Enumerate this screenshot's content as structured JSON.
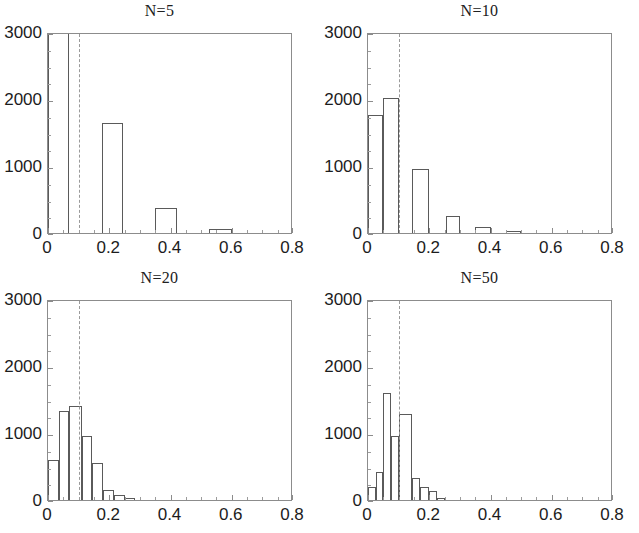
{
  "figure": {
    "background": "#ffffff",
    "axis_color": "#8c8c8c",
    "bar_edge_color": "#5a5a5a",
    "refline_color": "#9a9a9a",
    "panel_count": 4
  },
  "chart_data": [
    {
      "type": "bar",
      "title": "N=5",
      "xlabel": "",
      "ylabel": "",
      "xlim": [
        0,
        0.8
      ],
      "ylim": [
        0,
        3000
      ],
      "xticks": [
        0,
        0.2,
        0.4,
        0.6,
        0.8
      ],
      "xtick_labels": [
        "0",
        "0.2",
        "0.4",
        "0.6",
        "0.8"
      ],
      "xticks_minor": [
        0.05,
        0.1,
        0.15,
        0.25,
        0.3,
        0.35,
        0.45,
        0.5,
        0.55,
        0.65,
        0.7,
        0.75
      ],
      "yticks": [
        0,
        1000,
        2000,
        3000
      ],
      "ytick_labels": [
        "0",
        "1000",
        "2000",
        "3000"
      ],
      "yticks_minor": [
        250,
        500,
        750,
        1250,
        1500,
        1750,
        2250,
        2500,
        2750
      ],
      "grid": false,
      "legend": "none",
      "reference_line_x": 0.1,
      "bin_edges": [
        0.0,
        0.07,
        0.175,
        0.245,
        0.35,
        0.42,
        0.525,
        0.6
      ],
      "bins": [
        {
          "x0": 0.0,
          "x1": 0.07,
          "value": 2980
        },
        {
          "x0": 0.175,
          "x1": 0.245,
          "value": 1640
        },
        {
          "x0": 0.35,
          "x1": 0.42,
          "value": 380
        },
        {
          "x0": 0.525,
          "x1": 0.6,
          "value": 60
        }
      ]
    },
    {
      "type": "bar",
      "title": "N=10",
      "xlabel": "",
      "ylabel": "",
      "xlim": [
        0,
        0.8
      ],
      "ylim": [
        0,
        3000
      ],
      "xticks": [
        0,
        0.2,
        0.4,
        0.6,
        0.8
      ],
      "xtick_labels": [
        "0",
        "0.2",
        "0.4",
        "0.6",
        "0.8"
      ],
      "xticks_minor": [
        0.05,
        0.1,
        0.15,
        0.25,
        0.3,
        0.35,
        0.45,
        0.5,
        0.55,
        0.65,
        0.7,
        0.75
      ],
      "yticks": [
        0,
        1000,
        2000,
        3000
      ],
      "ytick_labels": [
        "0",
        "1000",
        "2000",
        "3000"
      ],
      "yticks_minor": [
        250,
        500,
        750,
        1250,
        1500,
        1750,
        2250,
        2500,
        2750
      ],
      "grid": false,
      "legend": "none",
      "reference_line_x": 0.1,
      "bin_edges": [
        0.0,
        0.05,
        0.1,
        0.145,
        0.2,
        0.255,
        0.3,
        0.35,
        0.4,
        0.45,
        0.5
      ],
      "bins": [
        {
          "x0": 0.0,
          "x1": 0.05,
          "value": 1760
        },
        {
          "x0": 0.05,
          "x1": 0.1,
          "value": 2020
        },
        {
          "x0": 0.145,
          "x1": 0.2,
          "value": 960
        },
        {
          "x0": 0.255,
          "x1": 0.3,
          "value": 250
        },
        {
          "x0": 0.35,
          "x1": 0.4,
          "value": 95
        },
        {
          "x0": 0.45,
          "x1": 0.5,
          "value": 35
        }
      ]
    },
    {
      "type": "bar",
      "title": "N=20",
      "xlabel": "",
      "ylabel": "",
      "xlim": [
        0,
        0.8
      ],
      "ylim": [
        0,
        3000
      ],
      "xticks": [
        0,
        0.2,
        0.4,
        0.6,
        0.8
      ],
      "xtick_labels": [
        "0",
        "0.2",
        "0.4",
        "0.6",
        "0.8"
      ],
      "xticks_minor": [
        0.05,
        0.1,
        0.15,
        0.25,
        0.3,
        0.35,
        0.45,
        0.5,
        0.55,
        0.65,
        0.7,
        0.75
      ],
      "yticks": [
        0,
        1000,
        2000,
        3000
      ],
      "ytick_labels": [
        "0",
        "1000",
        "2000",
        "3000"
      ],
      "yticks_minor": [
        250,
        500,
        750,
        1250,
        1500,
        1750,
        2250,
        2500,
        2750
      ],
      "grid": false,
      "legend": "none",
      "reference_line_x": 0.1,
      "bin_edges": [
        0.0,
        0.035,
        0.07,
        0.105,
        0.145,
        0.18,
        0.215,
        0.25,
        0.285,
        0.32
      ],
      "bins": [
        {
          "x0": 0.0,
          "x1": 0.035,
          "value": 590
        },
        {
          "x0": 0.035,
          "x1": 0.07,
          "value": 1330
        },
        {
          "x0": 0.07,
          "x1": 0.11,
          "value": 1410
        },
        {
          "x0": 0.11,
          "x1": 0.145,
          "value": 960
        },
        {
          "x0": 0.145,
          "x1": 0.18,
          "value": 550
        },
        {
          "x0": 0.18,
          "x1": 0.215,
          "value": 150
        },
        {
          "x0": 0.215,
          "x1": 0.25,
          "value": 70
        },
        {
          "x0": 0.25,
          "x1": 0.285,
          "value": 30
        }
      ]
    },
    {
      "type": "bar",
      "title": "N=50",
      "xlabel": "",
      "ylabel": "",
      "xlim": [
        0,
        0.8
      ],
      "ylim": [
        0,
        3000
      ],
      "xticks": [
        0,
        0.2,
        0.4,
        0.6,
        0.8
      ],
      "xtick_labels": [
        "0",
        "0.2",
        "0.4",
        "0.6",
        "0.8"
      ],
      "xticks_minor": [
        0.05,
        0.1,
        0.15,
        0.25,
        0.3,
        0.35,
        0.45,
        0.5,
        0.55,
        0.65,
        0.7,
        0.75
      ],
      "yticks": [
        0,
        1000,
        2000,
        3000
      ],
      "ytick_labels": [
        "0",
        "1000",
        "2000",
        "3000"
      ],
      "yticks_minor": [
        250,
        500,
        750,
        1250,
        1500,
        1750,
        2250,
        2500,
        2750
      ],
      "grid": false,
      "legend": "none",
      "reference_line_x": 0.1,
      "bin_edges": [
        0.0,
        0.025,
        0.05,
        0.075,
        0.1,
        0.125,
        0.15,
        0.175,
        0.2,
        0.225,
        0.25
      ],
      "bins": [
        {
          "x0": 0.0,
          "x1": 0.025,
          "value": 190
        },
        {
          "x0": 0.025,
          "x1": 0.05,
          "value": 420
        },
        {
          "x0": 0.05,
          "x1": 0.075,
          "value": 1600
        },
        {
          "x0": 0.075,
          "x1": 0.1,
          "value": 960
        },
        {
          "x0": 0.1,
          "x1": 0.145,
          "value": 1280
        },
        {
          "x0": 0.145,
          "x1": 0.17,
          "value": 330
        },
        {
          "x0": 0.17,
          "x1": 0.2,
          "value": 190
        },
        {
          "x0": 0.2,
          "x1": 0.225,
          "value": 130
        },
        {
          "x0": 0.225,
          "x1": 0.25,
          "value": 35
        }
      ]
    }
  ]
}
